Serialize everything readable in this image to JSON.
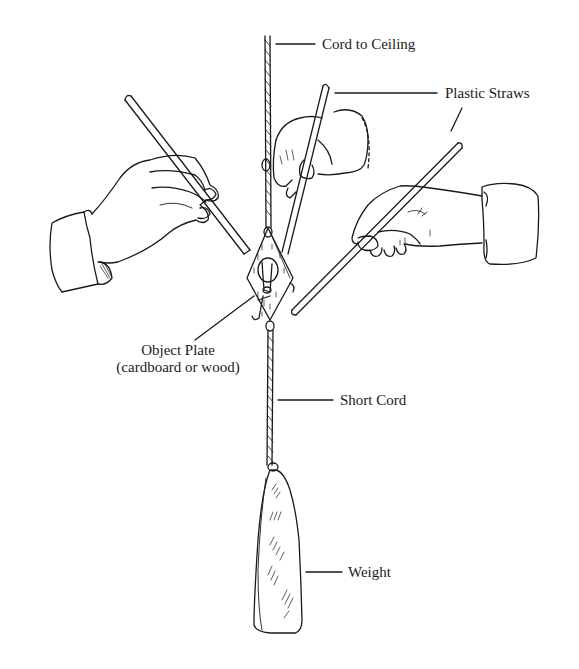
{
  "diagram": {
    "type": "labeled-illustration",
    "colors": {
      "ink": "#1a1a1a",
      "background": "#ffffff"
    },
    "labels": {
      "cord_to_ceiling": "Cord to Ceiling",
      "plastic_straws": "Plastic Straws",
      "object_plate_line1": "Object Plate",
      "object_plate_line2": "(cardboard or wood)",
      "short_cord": "Short Cord",
      "weight": "Weight"
    },
    "parts": [
      {
        "name": "cord-to-ceiling",
        "label": "Cord to Ceiling"
      },
      {
        "name": "plastic-straws",
        "label": "Plastic Straws",
        "count": 3
      },
      {
        "name": "object-plate",
        "label": "Object Plate (cardboard or wood)"
      },
      {
        "name": "short-cord",
        "label": "Short Cord"
      },
      {
        "name": "weight",
        "label": "Weight"
      },
      {
        "name": "hands",
        "count": 3
      }
    ]
  }
}
